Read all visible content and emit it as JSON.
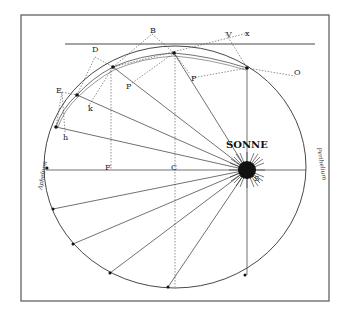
{
  "diagram": {
    "sun_label": "SONNE",
    "sun_symbol": "☉",
    "aphelion_label": "Aphelium",
    "perihelion_label": "Perihelium",
    "labels": {
      "B": "B",
      "D": "D",
      "E": "E",
      "V": "V",
      "x": "x",
      "O": "O",
      "P_left": "P",
      "P_right": "P",
      "k": "k",
      "h": "h",
      "F": "F",
      "C": "C",
      "S": "S",
      "upper_points": [
        "γ",
        "δ",
        "ε",
        "α",
        "β"
      ],
      "lower_points": [
        "π",
        "ν",
        "τ",
        "κ"
      ]
    },
    "colors": {
      "ink": "#222222",
      "frame": "#555555",
      "background": "#ffffff"
    }
  }
}
